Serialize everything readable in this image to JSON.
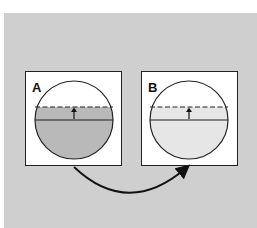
{
  "diagram": {
    "background_color": "#cfcfcf",
    "panels": [
      {
        "label": "A",
        "fill_color": "#b9b9b9",
        "description": "Sphere partially filled with dark liquid; solid line marks current level, dashed line marks raised level, arrow points up"
      },
      {
        "label": "B",
        "fill_color": "#e6e6e6",
        "description": "Sphere partially filled with light liquid; solid line marks current level, dashed line marks raised level, arrow points up"
      }
    ],
    "connector": {
      "from": "A",
      "to": "B",
      "style": "curved arrow below panels"
    }
  }
}
